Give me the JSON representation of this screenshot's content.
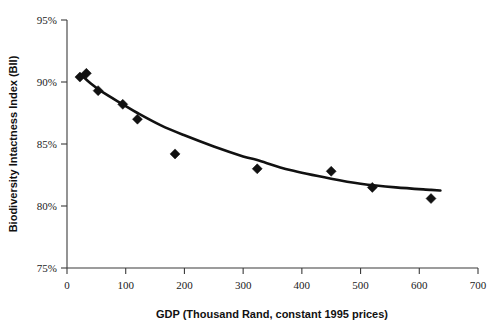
{
  "chart_data": {
    "type": "scatter",
    "title": "",
    "xlabel": "GDP (Thousand Rand, constant 1995 prices)",
    "ylabel": "Biodiversity Intactness Index (BII)",
    "xlim": [
      0,
      700
    ],
    "ylim": [
      75,
      95
    ],
    "xticks": [
      0,
      100,
      200,
      300,
      400,
      500,
      600,
      700
    ],
    "xtick_labels": [
      "0",
      "100",
      "200",
      "300",
      "400",
      "500",
      "600",
      "700"
    ],
    "yticks": [
      75,
      80,
      85,
      90,
      95
    ],
    "ytick_labels": [
      "75%",
      "80%",
      "85%",
      "90%",
      "95%"
    ],
    "grid": false,
    "legend": null,
    "marker_shape": "diamond",
    "marker_color": "#111111",
    "curve_color": "#111111",
    "series": [
      {
        "name": "Observations",
        "x": [
          22,
          33,
          53,
          95,
          120,
          184,
          324,
          450,
          520,
          620
        ],
        "y": [
          90.4,
          90.7,
          89.3,
          88.2,
          87.0,
          84.2,
          83.0,
          82.8,
          81.5,
          80.6
        ]
      },
      {
        "name": "Fitted curve",
        "type": "line",
        "x": [
          24,
          40,
          60,
          95,
          120,
          160,
          200,
          250,
          300,
          324,
          380,
          450,
          500,
          560,
          620,
          636
        ],
        "y": [
          90.6,
          89.9,
          89.2,
          88.2,
          87.5,
          86.5,
          85.7,
          84.8,
          84.0,
          83.7,
          82.9,
          82.2,
          81.8,
          81.5,
          81.3,
          81.25
        ]
      }
    ]
  },
  "axes": {
    "x_title": "GDP (Thousand Rand, constant 1995 prices)",
    "y_title": "Biodiversity Intactness Index (BII)"
  }
}
